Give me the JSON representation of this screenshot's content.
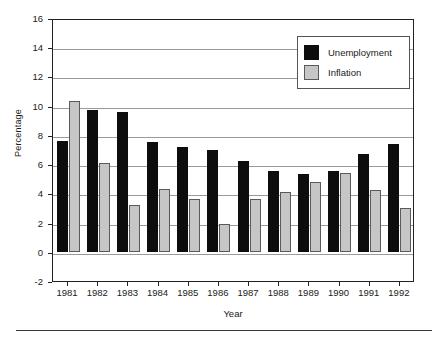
{
  "chart_data": {
    "type": "bar",
    "title": "",
    "subtitle": "",
    "xlabel": "Year",
    "ylabel": "Percentage",
    "categories": [
      "1981",
      "1982",
      "1983",
      "1984",
      "1985",
      "1986",
      "1987",
      "1988",
      "1989",
      "1990",
      "1991",
      "1992"
    ],
    "series": [
      {
        "name": "Unemployment",
        "color": "#0d0d0d",
        "values": [
          7.6,
          9.7,
          9.6,
          7.5,
          7.2,
          7.0,
          6.2,
          5.5,
          5.3,
          5.5,
          6.7,
          7.4
        ]
      },
      {
        "name": "Inflation",
        "color": "#c6c6c6",
        "values": [
          10.3,
          6.1,
          3.2,
          4.3,
          3.6,
          1.9,
          3.6,
          4.1,
          4.8,
          5.4,
          4.2,
          3.0
        ]
      }
    ],
    "ylim": [
      -2,
      16
    ],
    "ytick_labels": [
      "16",
      "14",
      "12",
      "10",
      "8",
      "6",
      "4",
      "2",
      "0",
      "-2"
    ],
    "ytick_values": [
      16,
      14,
      12,
      10,
      8,
      6,
      4,
      2,
      0,
      -2
    ],
    "grid": true,
    "legend_position": "top-right",
    "legend_entries": [
      "Unemployment",
      "Inflation"
    ]
  }
}
